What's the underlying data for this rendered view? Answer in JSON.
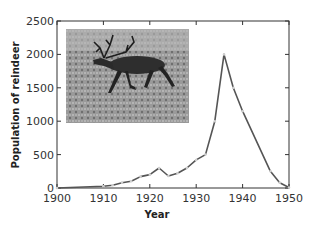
{
  "chart_data": {
    "type": "line",
    "title": "",
    "xlabel": "Year",
    "ylabel": "Population of reindeer",
    "xlim": [
      1900,
      1950
    ],
    "ylim": [
      0,
      2500
    ],
    "xticks": [
      1900,
      1910,
      1920,
      1930,
      1940,
      1950
    ],
    "yticks": [
      0,
      500,
      1000,
      1500,
      2000,
      2500
    ],
    "grid": false,
    "legend": null,
    "series": [
      {
        "name": "Reindeer population",
        "color": "#555555",
        "x": [
          1900,
          1910,
          1912,
          1914,
          1916,
          1918,
          1920,
          1922,
          1924,
          1926,
          1928,
          1930,
          1932,
          1934,
          1936,
          1938,
          1940,
          1946,
          1948,
          1950
        ],
        "y": [
          0,
          25,
          40,
          80,
          100,
          170,
          200,
          300,
          180,
          220,
          300,
          420,
          500,
          1000,
          2000,
          1500,
          1150,
          250,
          80,
          8
        ]
      }
    ],
    "inset_image": "photo of a reindeer (caribou) walking on tundra"
  },
  "axes": {
    "x_title": "Year",
    "y_title": "Population of reindeer"
  }
}
